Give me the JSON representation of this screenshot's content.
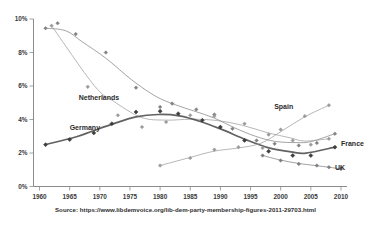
{
  "chart_data": {
    "type": "scatter",
    "title": "",
    "xlabel": "",
    "ylabel": "",
    "xlim": [
      1959,
      2011
    ],
    "ylim": [
      0,
      10
    ],
    "grid": false,
    "legend_position": "inline-labels",
    "y_tick_labels": [
      "0%",
      "2%",
      "4%",
      "6%",
      "8%",
      "10%"
    ],
    "y_tick_values": [
      0,
      2,
      4,
      6,
      8,
      10
    ],
    "x_tick_labels": [
      "1960",
      "1965",
      "1970",
      "1975",
      "1980",
      "1985",
      "1990",
      "1995",
      "2000",
      "2005",
      "2010"
    ],
    "x_tick_values": [
      1960,
      1965,
      1970,
      1975,
      1980,
      1985,
      1990,
      1995,
      2000,
      2005,
      2010
    ],
    "annotations": [
      {
        "text": "Netherlands",
        "x": 1966.5,
        "y": 5.15
      },
      {
        "text": "Germany",
        "x": 1965.0,
        "y": 3.35
      },
      {
        "text": "Spain",
        "x": 2000.5,
        "y": 4.65
      },
      {
        "text": "France",
        "x": 2010.0,
        "y": 2.4
      },
      {
        "text": "UK",
        "x": 2009.0,
        "y": 1.0
      }
    ],
    "series": [
      {
        "name": "Austria",
        "color": "#808080",
        "marker": "diamond",
        "points": [
          {
            "x": 1961,
            "y": 9.45
          },
          {
            "x": 1963,
            "y": 9.75
          },
          {
            "x": 1966,
            "y": 9.1
          },
          {
            "x": 1971,
            "y": 8.0
          },
          {
            "x": 1976,
            "y": 5.9
          },
          {
            "x": 1980,
            "y": 4.75
          },
          {
            "x": 1982,
            "y": 4.95
          },
          {
            "x": 1986,
            "y": 4.6
          },
          {
            "x": 1989,
            "y": 4.3
          },
          {
            "x": 1992,
            "y": 3.45
          },
          {
            "x": 1996,
            "y": 2.75
          },
          {
            "x": 1999,
            "y": 2.55
          },
          {
            "x": 2003,
            "y": 2.45
          },
          {
            "x": 2006,
            "y": 2.6
          },
          {
            "x": 2009,
            "y": 3.15
          }
        ]
      },
      {
        "name": "Netherlands",
        "color": "#9a9a9a",
        "marker": "diamond",
        "points": [
          {
            "x": 1962,
            "y": 9.6
          },
          {
            "x": 1968,
            "y": 5.95
          },
          {
            "x": 1973,
            "y": 4.25
          },
          {
            "x": 1977,
            "y": 3.55
          },
          {
            "x": 1981,
            "y": 3.85
          },
          {
            "x": 1985,
            "y": 4.25
          },
          {
            "x": 1989,
            "y": 4.2
          },
          {
            "x": 1994,
            "y": 3.75
          },
          {
            "x": 1998,
            "y": 3.1
          },
          {
            "x": 2002,
            "y": 2.75
          },
          {
            "x": 2005,
            "y": 2.5
          },
          {
            "x": 2008,
            "y": 2.85
          }
        ]
      },
      {
        "name": "Germany",
        "color": "#5a5a5a",
        "marker": "diamond",
        "points": [
          {
            "x": 1961,
            "y": 2.5
          },
          {
            "x": 1965,
            "y": 2.8
          },
          {
            "x": 1969,
            "y": 3.2
          },
          {
            "x": 1972,
            "y": 3.75
          },
          {
            "x": 1976,
            "y": 4.45
          },
          {
            "x": 1980,
            "y": 4.5
          },
          {
            "x": 1983,
            "y": 4.35
          },
          {
            "x": 1987,
            "y": 3.95
          },
          {
            "x": 1990,
            "y": 3.55
          },
          {
            "x": 1994,
            "y": 2.75
          },
          {
            "x": 1998,
            "y": 2.1
          },
          {
            "x": 2002,
            "y": 1.85
          },
          {
            "x": 2005,
            "y": 1.85
          },
          {
            "x": 2009,
            "y": 2.35
          }
        ]
      },
      {
        "name": "Spain",
        "color": "#9a9a9a",
        "marker": "diamond",
        "points": [
          {
            "x": 1980,
            "y": 1.25
          },
          {
            "x": 1985,
            "y": 1.7
          },
          {
            "x": 1989,
            "y": 2.2
          },
          {
            "x": 1993,
            "y": 2.35
          },
          {
            "x": 1997,
            "y": 2.3
          },
          {
            "x": 2000,
            "y": 3.4
          },
          {
            "x": 2004,
            "y": 4.2
          },
          {
            "x": 2008,
            "y": 4.85
          }
        ]
      },
      {
        "name": "UK",
        "color": "#7d7d7d",
        "marker": "diamond",
        "points": [
          {
            "x": 1997,
            "y": 1.85
          },
          {
            "x": 2000,
            "y": 1.55
          },
          {
            "x": 2003,
            "y": 1.35
          },
          {
            "x": 2006,
            "y": 1.25
          },
          {
            "x": 2008,
            "y": 1.15
          },
          {
            "x": 2010,
            "y": 1.05
          }
        ]
      }
    ]
  },
  "source": {
    "text": "Source: https://www.libdemvoice.org/lib-dem-party-membership-figures-2011-29703.html"
  }
}
